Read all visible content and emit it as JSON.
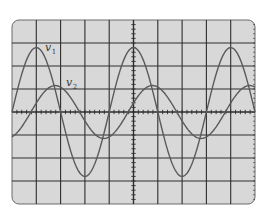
{
  "chart_data": {
    "type": "line",
    "title": "",
    "xlabel": "",
    "ylabel": "",
    "grid": true,
    "grid_divisions": {
      "x": 10,
      "y": 8
    },
    "minor_ticks_per_division": 5,
    "xlim": [
      0,
      10
    ],
    "ylim": [
      -4,
      4
    ],
    "legend": "inline labels",
    "series": [
      {
        "name": "v1",
        "label_main": "v",
        "label_sub": "1",
        "shape": "sinusoid",
        "amplitude_div": 2.8,
        "period_div": 4.0,
        "first_peak_div": 1.0,
        "peaks_x_div": [
          1.0,
          5.0,
          9.0
        ],
        "troughs_x_div": [
          3.0,
          7.0
        ],
        "label_pos": {
          "x": 45,
          "y": 51
        }
      },
      {
        "name": "v2",
        "label_main": "v",
        "label_sub": "2",
        "shape": "sinusoid",
        "amplitude_div": 1.15,
        "period_div": 4.0,
        "first_peak_div": 1.78,
        "peaks_x_div": [
          1.78,
          5.78,
          9.78
        ],
        "troughs_x_div": [
          3.78,
          7.78
        ],
        "phase_lag_deg_vs_v1": 70,
        "label_pos": {
          "x": 66,
          "y": 86
        }
      }
    ]
  },
  "colors": {
    "background": "#ffffff",
    "screen": "#d8d8d8",
    "screen_border": "#6a6a6a",
    "grid": "#2e2e2e",
    "trace": "#5a5a5a"
  },
  "layout": {
    "screen": {
      "x": 12,
      "y": 20,
      "w": 243,
      "h": 184,
      "radius": 7
    }
  }
}
